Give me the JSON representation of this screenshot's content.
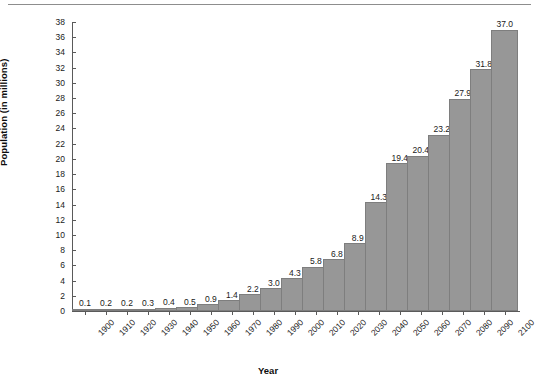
{
  "chart_data": {
    "type": "bar",
    "title": "",
    "subtitle": "",
    "xlabel": "Year",
    "ylabel": "Population (in millions)",
    "categories": [
      "1900",
      "1910",
      "1920",
      "1930",
      "1940",
      "1950",
      "1960",
      "1970",
      "1980",
      "1990",
      "2000",
      "2010",
      "2020",
      "2030",
      "2040",
      "2050",
      "2060",
      "2070",
      "2080",
      "2090",
      "2100"
    ],
    "values": [
      0.1,
      0.2,
      0.2,
      0.3,
      0.4,
      0.5,
      0.9,
      1.4,
      2.2,
      3.0,
      4.3,
      5.8,
      6.8,
      8.9,
      14.3,
      19.4,
      20.4,
      23.2,
      27.9,
      31.8,
      37.0
    ],
    "data_labels": [
      "0.1",
      "0.2",
      "0.2",
      "0.3",
      "0.4",
      "0.5",
      "0.9",
      "1.4",
      "2.2",
      "3.0",
      "4.3",
      "5.8",
      "6.8",
      "8.9",
      "14.3",
      "19.4",
      "20.4",
      "23.2",
      "27.9",
      "31.8",
      "37.0"
    ],
    "ylim": [
      0,
      38
    ],
    "ytick_values": [
      0,
      2,
      4,
      6,
      8,
      10,
      12,
      14,
      16,
      18,
      20,
      22,
      24,
      26,
      28,
      30,
      32,
      34,
      36,
      38
    ],
    "ytick_labels": [
      "0",
      "2",
      "4",
      "6",
      "8",
      "10",
      "12",
      "14",
      "16",
      "18",
      "20",
      "22",
      "24",
      "26",
      "28",
      "30",
      "32",
      "34",
      "36",
      "38"
    ],
    "grid": false,
    "legend": null,
    "legend_position": "none",
    "bar_color": "#979797",
    "bar_edge_color": "#7e7e7e",
    "axis_color": "#5a5a5a",
    "text_color": "#1a1a1a",
    "background": "#ffffff",
    "xtick_rotation": -45,
    "annotations": []
  },
  "decor": {
    "top_rule_color": "#8d8d8d"
  }
}
